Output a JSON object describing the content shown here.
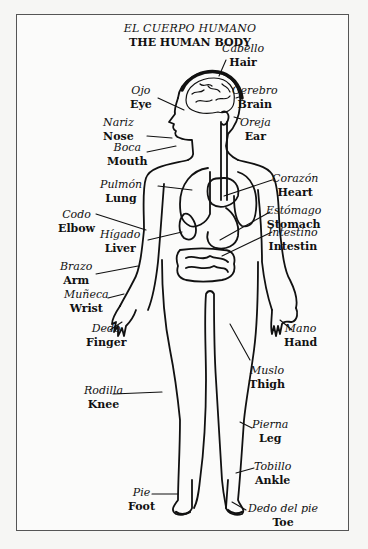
{
  "title": {
    "spanish": "EL CUERPO HUMANO",
    "english": "THE HUMAN BODY"
  },
  "labels": [
    {
      "id": "hair",
      "spanish": "Cabello",
      "english": "Hair"
    },
    {
      "id": "brain",
      "spanish": "Cerebro",
      "english": "Brain"
    },
    {
      "id": "eye",
      "spanish": "Ojo",
      "english": "Eye"
    },
    {
      "id": "nose",
      "spanish": "Nariz",
      "english": "Nose"
    },
    {
      "id": "ear",
      "spanish": "Oreja",
      "english": "Ear"
    },
    {
      "id": "mouth",
      "spanish": "Boca",
      "english": "Mouth"
    },
    {
      "id": "heart",
      "spanish": "Corazón",
      "english": "Heart"
    },
    {
      "id": "lung",
      "spanish": "Pulmón",
      "english": "Lung"
    },
    {
      "id": "stomach",
      "spanish": "Estómago",
      "english": "Stomach"
    },
    {
      "id": "elbow",
      "spanish": "Codo",
      "english": "Elbow"
    },
    {
      "id": "intestine",
      "spanish": "Intestino",
      "english": "Intestin"
    },
    {
      "id": "liver",
      "spanish": "Hígado",
      "english": "Liver"
    },
    {
      "id": "arm",
      "spanish": "Brazo",
      "english": "Arm"
    },
    {
      "id": "wrist",
      "spanish": "Muñeca",
      "english": "Wrist"
    },
    {
      "id": "hand",
      "spanish": "Mano",
      "english": "Hand"
    },
    {
      "id": "finger",
      "spanish": "Dedo",
      "english": "Finger"
    },
    {
      "id": "thigh",
      "spanish": "Muslo",
      "english": "Thigh"
    },
    {
      "id": "knee",
      "spanish": "Rodilla",
      "english": "Knee"
    },
    {
      "id": "leg",
      "spanish": "Pierna",
      "english": "Leg"
    },
    {
      "id": "ankle",
      "spanish": "Tobillo",
      "english": "Ankle"
    },
    {
      "id": "foot",
      "spanish": "Pie",
      "english": "Foot"
    },
    {
      "id": "toe",
      "spanish": "Dedo del pie",
      "english": "Toe"
    }
  ],
  "colors": {
    "ink": "#111111",
    "paper": "#fbfbfa",
    "frame": "#555555"
  }
}
